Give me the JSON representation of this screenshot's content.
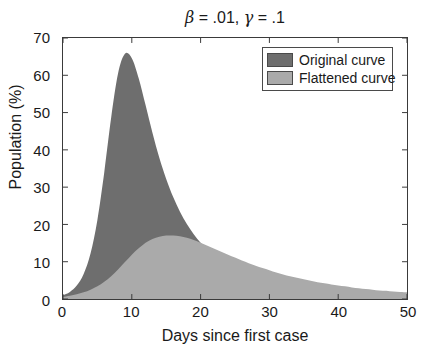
{
  "chart_data": {
    "type": "area",
    "title": "β = .01, γ = .1",
    "title_parts": {
      "beta_symbol": "β",
      "beta_value": "= .01,",
      "gamma_symbol": "γ",
      "gamma_value": "= .1"
    },
    "xlabel": "Days since first case",
    "ylabel": "Population (%)",
    "xlim": [
      0,
      50
    ],
    "ylim": [
      0,
      70
    ],
    "xticks": [
      0,
      10,
      20,
      30,
      40,
      50
    ],
    "yticks": [
      0,
      10,
      20,
      30,
      40,
      50,
      60,
      70
    ],
    "grid": false,
    "legend_position": "top-right",
    "colors": {
      "original": "#6e6e6e",
      "flattened": "#aaaaaa",
      "axis": "#3a3a3a",
      "text": "#1a1a1a",
      "background": "#ffffff"
    },
    "x": [
      0,
      1,
      2,
      3,
      4,
      5,
      6,
      7,
      8,
      9,
      10,
      11,
      12,
      13,
      14,
      15,
      16,
      17,
      18,
      19,
      20,
      21,
      22,
      23,
      24,
      25,
      26,
      27,
      28,
      29,
      30,
      31,
      32,
      33,
      34,
      35,
      36,
      37,
      38,
      39,
      40,
      41,
      42,
      43,
      44,
      45,
      46,
      47,
      48,
      49,
      50
    ],
    "series": [
      {
        "name": "Original curve",
        "color": "#6e6e6e",
        "values": [
          1.0,
          1.9,
          3.6,
          6.7,
          12.2,
          21.2,
          34.0,
          48.6,
          60.5,
          65.8,
          64.6,
          59.2,
          52.0,
          44.6,
          37.9,
          32.2,
          27.4,
          23.4,
          20.1,
          17.4,
          15.1,
          13.2,
          11.6,
          10.2,
          9.1,
          8.1,
          7.2,
          6.5,
          5.8,
          5.3,
          4.8,
          4.4,
          4.0,
          3.7,
          3.4,
          3.1,
          2.9,
          2.7,
          2.5,
          2.3,
          2.2,
          2.0,
          1.9,
          1.8,
          1.7,
          1.6,
          1.5,
          1.4,
          1.35,
          1.3,
          1.25
        ]
      },
      {
        "name": "Flattened curve",
        "color": "#aaaaaa",
        "values": [
          0.6,
          0.9,
          1.3,
          1.8,
          2.5,
          3.4,
          4.6,
          6.1,
          7.9,
          9.9,
          11.9,
          13.6,
          15.1,
          16.1,
          16.7,
          17.0,
          17.0,
          16.8,
          16.4,
          15.8,
          15.1,
          14.3,
          13.5,
          12.7,
          11.9,
          11.1,
          10.3,
          9.6,
          8.9,
          8.3,
          7.7,
          7.1,
          6.6,
          6.1,
          5.7,
          5.3,
          4.9,
          4.5,
          4.2,
          3.9,
          3.6,
          3.4,
          3.1,
          2.9,
          2.7,
          2.5,
          2.3,
          2.2,
          2.0,
          1.9,
          1.8
        ]
      }
    ],
    "annotations": {
      "original_peak": {
        "x": 8.1,
        "y": 66
      },
      "flattened_peak": {
        "x": 16,
        "y": 17
      }
    }
  },
  "legend": {
    "items": [
      {
        "label": "Original curve",
        "color": "#6e6e6e"
      },
      {
        "label": "Flattened curve",
        "color": "#aaaaaa"
      }
    ]
  }
}
